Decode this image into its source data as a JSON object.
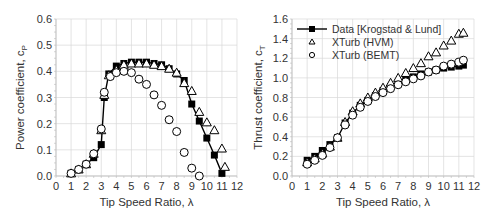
{
  "chart_data": [
    {
      "type": "scatter",
      "title": "",
      "xlabel": "Tip Speed Ratio, λ",
      "ylabel": "Power coefficient, c",
      "ylabel_sub": "P",
      "xlim": [
        0,
        12
      ],
      "ylim": [
        0,
        0.6
      ],
      "xticks": [
        "0",
        "1",
        "2",
        "3",
        "4",
        "5",
        "6",
        "7",
        "8",
        "9",
        "10",
        "11",
        "12"
      ],
      "yticks": [
        "0.0",
        "0.1",
        "0.2",
        "0.3",
        "0.4",
        "0.5",
        "0.6"
      ],
      "grid": true,
      "series": [
        {
          "name": "Data [Krogstad & Lund]",
          "marker": "filled-square",
          "line": true,
          "x": [
            1.0,
            1.5,
            2.0,
            2.5,
            3.0,
            3.2,
            3.5,
            4.0,
            4.5,
            5.0,
            5.5,
            6.0,
            6.5,
            7.0,
            7.5,
            8.0,
            8.5,
            9.0,
            9.5,
            10.0,
            10.5,
            11.0
          ],
          "y": [
            0.01,
            0.025,
            0.045,
            0.07,
            0.12,
            0.3,
            0.39,
            0.42,
            0.43,
            0.435,
            0.435,
            0.435,
            0.43,
            0.425,
            0.41,
            0.39,
            0.365,
            0.275,
            0.21,
            0.145,
            0.08,
            0.01
          ]
        },
        {
          "name": "XTurb (HVM)",
          "marker": "open-triangle",
          "line": false,
          "x": [
            1.0,
            1.5,
            2.0,
            2.5,
            3.0,
            3.2,
            3.5,
            4.0,
            4.5,
            5.0,
            5.5,
            6.0,
            6.5,
            7.0,
            7.5,
            8.0,
            8.5,
            9.0,
            9.5,
            10.0,
            10.5,
            11.0,
            11.2
          ],
          "y": [
            0.01,
            0.025,
            0.045,
            0.085,
            0.175,
            0.31,
            0.385,
            0.405,
            0.425,
            0.43,
            0.43,
            0.43,
            0.425,
            0.42,
            0.41,
            0.395,
            0.355,
            0.325,
            0.245,
            0.205,
            0.175,
            0.105,
            0.035
          ]
        },
        {
          "name": "XTurb (BEMT)",
          "marker": "open-circle",
          "line": false,
          "x": [
            1.0,
            1.5,
            2.0,
            2.5,
            3.0,
            3.2,
            3.6,
            4.0,
            4.5,
            5.0,
            5.5,
            6.0,
            6.5,
            7.0,
            7.5,
            8.0,
            8.5,
            9.0,
            9.5
          ],
          "y": [
            0.01,
            0.025,
            0.045,
            0.085,
            0.18,
            0.32,
            0.38,
            0.395,
            0.4,
            0.395,
            0.37,
            0.35,
            0.31,
            0.27,
            0.215,
            0.17,
            0.09,
            0.03,
            0.0
          ]
        }
      ]
    },
    {
      "type": "scatter",
      "title": "",
      "xlabel": "Tip Speed Ratio, λ",
      "ylabel": "Thrust coefficient, c",
      "ylabel_sub": "T",
      "xlim": [
        0,
        12
      ],
      "ylim": [
        0,
        1.6
      ],
      "xticks": [
        "0",
        "1",
        "2",
        "3",
        "4",
        "5",
        "6",
        "7",
        "8",
        "9",
        "10",
        "11",
        "12"
      ],
      "yticks": [
        "0.0",
        "0.2",
        "0.4",
        "0.6",
        "0.8",
        "1.0",
        "1.2",
        "1.4",
        "1.6"
      ],
      "grid": true,
      "legend": "top-left",
      "series": [
        {
          "name": "Data [Krogstad & Lund]",
          "marker": "filled-square",
          "line": true,
          "x": [
            1.0,
            1.5,
            2.0,
            2.5,
            3.0,
            3.5,
            4.0,
            4.5,
            5.0,
            5.5,
            6.0,
            6.5,
            7.0,
            7.5,
            8.0,
            8.5,
            9.0,
            9.5,
            10.0,
            10.5,
            11.0,
            11.3
          ],
          "y": [
            0.16,
            0.2,
            0.26,
            0.32,
            0.39,
            0.54,
            0.64,
            0.72,
            0.77,
            0.82,
            0.87,
            0.91,
            0.95,
            0.99,
            1.01,
            1.04,
            1.06,
            1.08,
            1.1,
            1.11,
            1.12,
            1.13
          ]
        },
        {
          "name": "XTurb (HVM)",
          "marker": "open-triangle",
          "line": false,
          "x": [
            1.0,
            1.5,
            2.0,
            2.5,
            3.0,
            3.5,
            4.0,
            4.5,
            5.0,
            5.5,
            6.0,
            6.5,
            7.0,
            7.5,
            8.0,
            8.5,
            9.0,
            9.5,
            10.0,
            10.5,
            11.0,
            11.3
          ],
          "y": [
            0.14,
            0.18,
            0.23,
            0.3,
            0.39,
            0.55,
            0.66,
            0.74,
            0.8,
            0.85,
            0.9,
            0.95,
            1.0,
            1.05,
            1.1,
            1.15,
            1.22,
            1.26,
            1.33,
            1.38,
            1.45,
            1.46
          ]
        },
        {
          "name": "XTurb (BEMT)",
          "marker": "open-circle",
          "line": false,
          "x": [
            1.0,
            1.5,
            2.0,
            2.5,
            3.0,
            3.5,
            4.0,
            4.5,
            5.0,
            5.5,
            6.0,
            6.5,
            7.0,
            7.5,
            8.0,
            8.5,
            9.0,
            9.5,
            10.0,
            10.5,
            11.0,
            11.3
          ],
          "y": [
            0.12,
            0.16,
            0.21,
            0.29,
            0.39,
            0.52,
            0.62,
            0.7,
            0.76,
            0.81,
            0.85,
            0.89,
            0.93,
            0.96,
            0.99,
            1.02,
            1.06,
            1.08,
            1.12,
            1.14,
            1.16,
            1.18
          ]
        }
      ]
    }
  ],
  "legend": {
    "items": [
      {
        "label": "Data [Krogstad & Lund]",
        "marker": "filled-square"
      },
      {
        "label": "XTurb (HVM)",
        "marker": "open-triangle"
      },
      {
        "label": "XTurb (BEMT)",
        "marker": "open-circle"
      }
    ]
  },
  "colors": {
    "marker": "#000000",
    "grid": "#d9d9d9",
    "text": "#333333"
  }
}
